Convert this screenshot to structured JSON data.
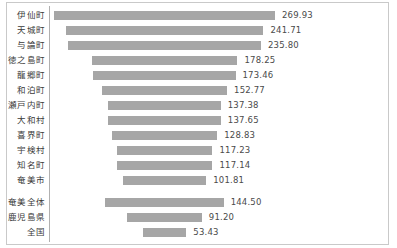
{
  "chart_data": {
    "type": "bar",
    "title": "",
    "subtitle": "",
    "xlabel": "",
    "ylabel": "",
    "orientation": "horizontal",
    "bar_alignment": "centered",
    "grid": false,
    "legend": false,
    "axis_ticks_visible": false,
    "value_labels_visible": true,
    "xlim": [
      0,
      269.93
    ],
    "colors": {
      "bar": "#a6a6a6",
      "frame": "#c9c9c9",
      "axis_line": "#b0b0b0",
      "label_text": "#3a3a3a",
      "value_text": "#4a4a4a",
      "background": "#ffffff"
    },
    "categories": [
      "伊仙町",
      "天城町",
      "与論町",
      "徳之島町",
      "龍郷町",
      "和泊町",
      "瀬戸内町",
      "大和村",
      "喜界町",
      "宇検村",
      "知名町",
      "奄美市",
      "奄美全体",
      "鹿児島県",
      "全国"
    ],
    "values": [
      269.93,
      241.71,
      235.8,
      178.25,
      173.46,
      152.77,
      137.38,
      137.65,
      128.83,
      117.23,
      117.14,
      101.81,
      144.5,
      91.2,
      53.43
    ],
    "value_labels": [
      "269.93",
      "241.71",
      "235.80",
      "178.25",
      "173.46",
      "152.77",
      "137.38",
      "137.65",
      "128.83",
      "117.23",
      "117.14",
      "101.81",
      "144.50",
      "91.20",
      "53.43"
    ],
    "group_break_after_index": 11
  }
}
